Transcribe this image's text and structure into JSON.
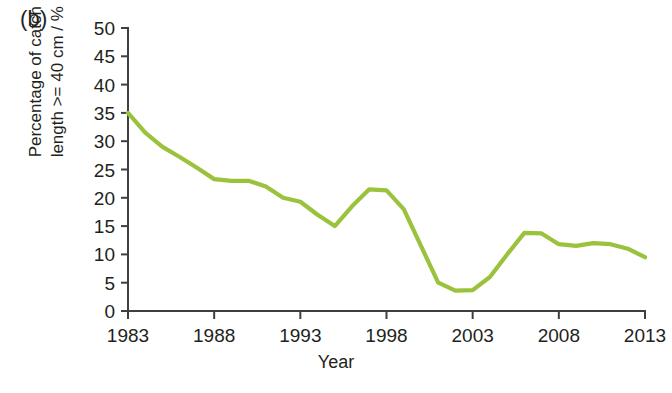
{
  "panel": {
    "label": "(b)"
  },
  "chart_data": {
    "type": "line",
    "title": "",
    "subtitle": "",
    "xlabel": "Year",
    "ylabel": "Percentage of catch\nlength >= 40 cm / %",
    "xlim": [
      1983,
      2013
    ],
    "ylim": [
      0,
      50
    ],
    "xticks": [
      1983,
      1988,
      1993,
      1998,
      2003,
      2008,
      2013
    ],
    "xticklabels": [
      "1983",
      "1988",
      "1993",
      "1998",
      "2003",
      "2008",
      "2013"
    ],
    "yticks": [
      0,
      5,
      10,
      15,
      20,
      25,
      30,
      35,
      40,
      45,
      50
    ],
    "yticklabels": [
      "0",
      "5",
      "10",
      "15",
      "20",
      "25",
      "30",
      "35",
      "40",
      "45",
      "50"
    ],
    "grid": false,
    "legend": false,
    "legend_position": "none",
    "series": [
      {
        "name": "Percentage of catch length >= 40 cm",
        "color": "#9ac23c",
        "x": [
          1983,
          1984,
          1985,
          1986,
          1987,
          1988,
          1989,
          1990,
          1991,
          1992,
          1993,
          1994,
          1995,
          1996,
          1997,
          1998,
          1999,
          2000,
          2001,
          2002,
          2003,
          2004,
          2005,
          2006,
          2007,
          2008,
          2009,
          2010,
          2011,
          2012,
          2013
        ],
        "values": [
          35.0,
          31.5,
          29.0,
          27.2,
          25.3,
          23.3,
          23.0,
          23.0,
          22.0,
          20.0,
          19.3,
          17.0,
          15.0,
          18.5,
          21.5,
          21.3,
          18.0,
          11.5,
          5.0,
          3.6,
          3.7,
          6.0,
          10.0,
          13.8,
          13.7,
          11.8,
          11.5,
          12.0,
          11.8,
          11.0,
          9.5
        ]
      }
    ]
  },
  "axes": {
    "accent_color": "#9ac23c",
    "axis_color": "#3f3f3f"
  }
}
